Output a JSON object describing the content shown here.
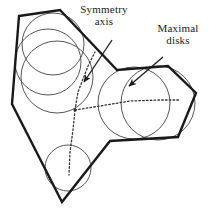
{
  "figure": {
    "background_color": "#ffffff",
    "stroke_color": "#1a1a1a",
    "circle_color": "#555555",
    "axis_color": "#333333",
    "width": 219,
    "height": 213
  },
  "annotations": [
    {
      "id": "symmetry-axis",
      "line1": "Symmetry",
      "line2": "axis",
      "arrow_from": [
        112,
        40
      ],
      "arrow_to": [
        84,
        82
      ]
    },
    {
      "id": "maximal-disks",
      "line1": "Maximal",
      "line2": "disks",
      "arrow_from": [
        163,
        57
      ],
      "arrow_to": [
        129,
        86
      ]
    }
  ],
  "chart_data": {
    "type": "diagram",
    "polygon": {
      "name": "outline-polygon",
      "vertices": [
        [
          19,
          16
        ],
        [
          60,
          10
        ],
        [
          117,
          70
        ],
        [
          168,
          66
        ],
        [
          196,
          93
        ],
        [
          178,
          137
        ],
        [
          110,
          141
        ],
        [
          62,
          202
        ],
        [
          12,
          104
        ]
      ]
    },
    "disks": [
      {
        "name": "disk-upper-left-top",
        "cx": 53,
        "cy": 44,
        "r": 31
      },
      {
        "name": "disk-upper-left-mid",
        "cx": 48,
        "cy": 62,
        "r": 33
      },
      {
        "name": "disk-upper-left-low",
        "cx": 57,
        "cy": 77,
        "r": 36
      },
      {
        "name": "disk-bottom-small",
        "cx": 68,
        "cy": 168,
        "r": 23
      },
      {
        "name": "disk-right-left",
        "cx": 134,
        "cy": 103,
        "r": 36
      },
      {
        "name": "disk-right-right",
        "cx": 158,
        "cy": 103,
        "r": 37
      }
    ],
    "medial_axis_branches": [
      {
        "name": "branch-to-upper-left",
        "points": [
          [
            75,
            110
          ],
          [
            78,
            92
          ],
          [
            88,
            66
          ],
          [
            95,
            52
          ]
        ]
      },
      {
        "name": "branch-to-bottom",
        "points": [
          [
            75,
            110
          ],
          [
            73,
            130
          ],
          [
            70,
            152
          ],
          [
            69,
            175
          ]
        ]
      },
      {
        "name": "branch-to-right",
        "points": [
          [
            75,
            110
          ],
          [
            100,
            106
          ],
          [
            130,
            101
          ],
          [
            160,
            100
          ],
          [
            180,
            100
          ]
        ]
      }
    ],
    "junction_point": [
      75,
      110
    ]
  }
}
